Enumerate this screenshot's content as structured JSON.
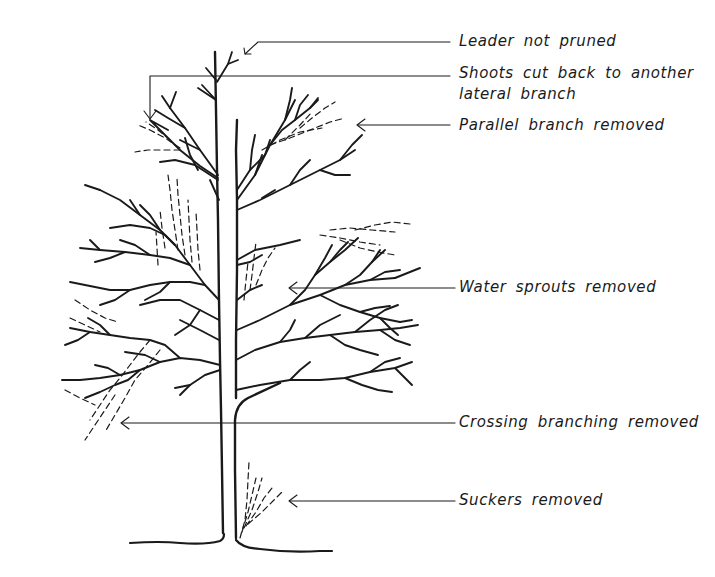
{
  "diagram": {
    "colors": {
      "ink": "#1a1a1a",
      "background": "#ffffff"
    },
    "labels": [
      {
        "id": "leader",
        "text": "Leader not pruned"
      },
      {
        "id": "shoots_line1",
        "text": "Shoots cut back to another"
      },
      {
        "id": "shoots_line2",
        "text": "lateral branch"
      },
      {
        "id": "parallel",
        "text": "Parallel branch removed"
      },
      {
        "id": "water",
        "text": "Water sprouts removed"
      },
      {
        "id": "crossing",
        "text": "Crossing branching removed"
      },
      {
        "id": "suckers",
        "text": "Suckers removed"
      }
    ],
    "legend": {
      "solid_line": "remaining branches",
      "dashed_line": "removed branches"
    }
  }
}
